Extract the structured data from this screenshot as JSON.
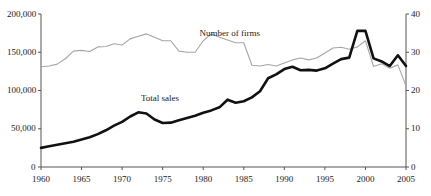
{
  "chart_data": {
    "type": "line",
    "title": "",
    "subtitle": "",
    "xlabel": "",
    "ylabel": "",
    "grid": false,
    "legend_position": "inline-annotation",
    "x": [
      1960,
      1961,
      1962,
      1963,
      1964,
      1965,
      1966,
      1967,
      1968,
      1969,
      1970,
      1971,
      1972,
      1973,
      1974,
      1975,
      1976,
      1977,
      1978,
      1979,
      1980,
      1981,
      1982,
      1983,
      1984,
      1985,
      1986,
      1987,
      1988,
      1989,
      1990,
      1991,
      1992,
      1993,
      1994,
      1995,
      1996,
      1997,
      1998,
      1999,
      2000,
      2001,
      2002,
      2003,
      2004,
      2005
    ],
    "xlim": [
      1960,
      2005
    ],
    "xticks": [
      1960,
      1965,
      1970,
      1975,
      1980,
      1985,
      1990,
      1995,
      2000,
      2005
    ],
    "xticklabels": [
      "1960",
      "1965",
      "1970",
      "1975",
      "1980",
      "1985",
      "1990",
      "1995",
      "2000",
      "2005"
    ],
    "left_axis": {
      "label": "",
      "ylim": [
        0,
        200000
      ],
      "yticks": [
        0,
        50000,
        100000,
        150000,
        200000
      ],
      "yticklabels": [
        "0",
        "50,000",
        "100,000",
        "150,000",
        "200,000"
      ]
    },
    "right_axis": {
      "label": "",
      "ylim": [
        0,
        40
      ],
      "yticks": [
        0,
        10,
        20,
        30,
        40
      ],
      "yticklabels": [
        "0",
        "10",
        "20",
        "30",
        "40"
      ]
    },
    "series": [
      {
        "name": "Total sales",
        "axis": "left",
        "color": "#111111",
        "width": 2.6,
        "annotation": "Total sales",
        "values": [
          25000,
          27000,
          29000,
          31000,
          33000,
          36000,
          39000,
          43000,
          48000,
          54000,
          59000,
          66000,
          71500,
          70000,
          62000,
          57500,
          58000,
          61000,
          64000,
          67000,
          71000,
          74000,
          78000,
          88000,
          84000,
          86000,
          91000,
          99000,
          116000,
          121000,
          128000,
          131000,
          126500,
          127000,
          126000,
          129000,
          135000,
          141000,
          143000,
          178000,
          178000,
          142000,
          138000,
          132000,
          146000,
          132000
        ]
      },
      {
        "name": "Number of firms",
        "axis": "right",
        "color": "#a6a6a6",
        "width": 1.1,
        "annotation": "Number of firms",
        "values": [
          26.2,
          26.4,
          26.9,
          28.3,
          30.3,
          30.5,
          30.2,
          31.4,
          31.5,
          32.2,
          31.9,
          33.5,
          34.2,
          34.8,
          33.9,
          33.0,
          33.0,
          30.3,
          30.0,
          30.0,
          33.0,
          34.8,
          33.9,
          33.2,
          32.5,
          32.5,
          26.6,
          26.4,
          26.8,
          26.4,
          27.2,
          28.0,
          28.5,
          28.0,
          28.5,
          29.8,
          31.1,
          31.3,
          30.8,
          31.4,
          33.0,
          26.3,
          27.0,
          25.8,
          26.7,
          21.2
        ]
      }
    ],
    "annotations": [
      {
        "text": "Total sales",
        "x_px": 160,
        "y_px": 94
      },
      {
        "text": "Number of firms",
        "x_px": 230,
        "y_px": 29
      }
    ]
  },
  "axes": {
    "left_ticks": [
      "200,000",
      "150,000",
      "100,000",
      "50,000",
      "0"
    ],
    "right_ticks": [
      "40",
      "30",
      "20",
      "10",
      "0"
    ],
    "x_ticks": [
      "1960",
      "1965",
      "1970",
      "1975",
      "1980",
      "1985",
      "1990",
      "1995",
      "2000",
      "2005"
    ]
  },
  "colors": {
    "total_sales": "#111111",
    "number_of_firms": "#a6a6a6",
    "axis": "#555555",
    "text": "#1a1a1a",
    "background": "#ffffff"
  }
}
